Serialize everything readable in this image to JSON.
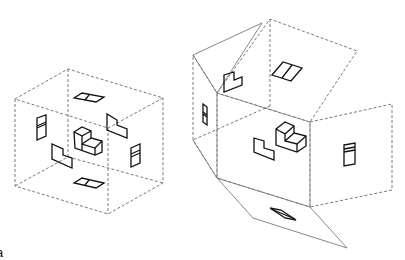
{
  "figure": {
    "panel_label_fragment": "a",
    "colors": {
      "background": "#ffffff",
      "edges_dashed": "#6b6b6b",
      "projections": "#111111"
    }
  },
  "left_box": {
    "name": "glass-box-projection",
    "faces": [
      "top",
      "front",
      "right-side",
      "left-side",
      "bottom",
      "back"
    ]
  },
  "right_net": {
    "name": "unfolded-glass-box",
    "panels": [
      "top",
      "left-side",
      "front",
      "right-side",
      "bottom",
      "back"
    ]
  }
}
